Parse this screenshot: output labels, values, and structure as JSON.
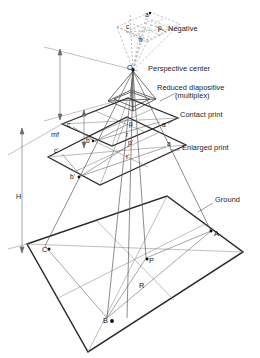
{
  "figure": {
    "background_color": "#ffffff",
    "line_color": "#3a3a3a",
    "dashed_color": "#8a8a8a",
    "text_color": "#1a1a1a",
    "width": 260,
    "height": 358
  },
  "callout_labels": [
    {
      "id": "negative",
      "text": "Negative",
      "x": 168,
      "y": 28
    },
    {
      "id": "perspective-center",
      "text": "Perspective center",
      "x": 148,
      "y": 68
    },
    {
      "id": "reduced-diapositive",
      "text": "Reduced diapositive",
      "x": 157,
      "y": 87
    },
    {
      "id": "multiplex",
      "text": "(multiplex)",
      "x": 175,
      "y": 95
    },
    {
      "id": "contact-print",
      "text": "Contact print",
      "x": 180,
      "y": 114
    },
    {
      "id": "enlarged-print",
      "text": "Enlarged print",
      "x": 182,
      "y": 147
    },
    {
      "id": "ground",
      "text": "Ground",
      "x": 215,
      "y": 199
    }
  ],
  "dimension_labels": [
    {
      "id": "mf",
      "text": "mf",
      "x": 51,
      "y": 134
    },
    {
      "id": "H",
      "text": "H",
      "x": 16,
      "y": 196
    }
  ],
  "image_points": {
    "negative_plane": [
      {
        "id": "neg-a",
        "label": "a",
        "x": 148,
        "y": 17
      },
      {
        "id": "neg-p",
        "label": "p",
        "x": 160,
        "y": 28
      },
      {
        "id": "neg-c",
        "label": "c",
        "x": 128,
        "y": 27
      },
      {
        "id": "neg-b",
        "label": "b",
        "x": 140,
        "y": 40
      }
    ],
    "perspective_center": {
      "id": "O",
      "label": "O",
      "x": 133,
      "y": 68
    },
    "contact_print": [
      {
        "id": "cp-c",
        "label": "c",
        "x": 67,
        "y": 125
      },
      {
        "id": "cp-p",
        "label": "p",
        "x": 129,
        "y": 124
      },
      {
        "id": "cp-a",
        "label": "a",
        "x": 162,
        "y": 125
      },
      {
        "id": "cp-r",
        "label": "r",
        "x": 126,
        "y": 135
      },
      {
        "id": "cp-b",
        "label": "b",
        "x": 88,
        "y": 141
      }
    ],
    "enlarged_print": [
      {
        "id": "ep-c",
        "label": "c'",
        "x": 56,
        "y": 151
      },
      {
        "id": "ep-p",
        "label": "p'",
        "x": 128,
        "y": 143
      },
      {
        "id": "ep-a",
        "label": "a",
        "x": 167,
        "y": 144
      },
      {
        "id": "ep-r",
        "label": "r'",
        "x": 126,
        "y": 157
      },
      {
        "id": "ep-b",
        "label": "b'",
        "x": 73,
        "y": 177
      }
    ],
    "ground_plane": [
      {
        "id": "gp-C",
        "label": "C",
        "x": 45,
        "y": 249
      },
      {
        "id": "gp-A",
        "label": "A",
        "x": 213,
        "y": 234
      },
      {
        "id": "gp-P",
        "label": "P",
        "x": 147,
        "y": 260
      },
      {
        "id": "gp-R",
        "label": "R",
        "x": 140,
        "y": 285
      },
      {
        "id": "gp-B",
        "label": "B",
        "x": 106,
        "y": 320
      }
    ]
  }
}
